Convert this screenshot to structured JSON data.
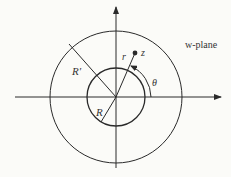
{
  "diagram": {
    "plane_label": "w-plane",
    "labels": {
      "outer_radius": "R′",
      "inner_radius": "R",
      "modulus": "r",
      "point": "z",
      "angle": "θ"
    },
    "geometry": {
      "center": [
        116,
        97
      ],
      "outer_circle_radius": 66,
      "inner_circle_radius": 29,
      "point_z": [
        135,
        53
      ]
    },
    "colors": {
      "stroke": "#2a2a2a",
      "background": "#fbfbf8"
    }
  }
}
